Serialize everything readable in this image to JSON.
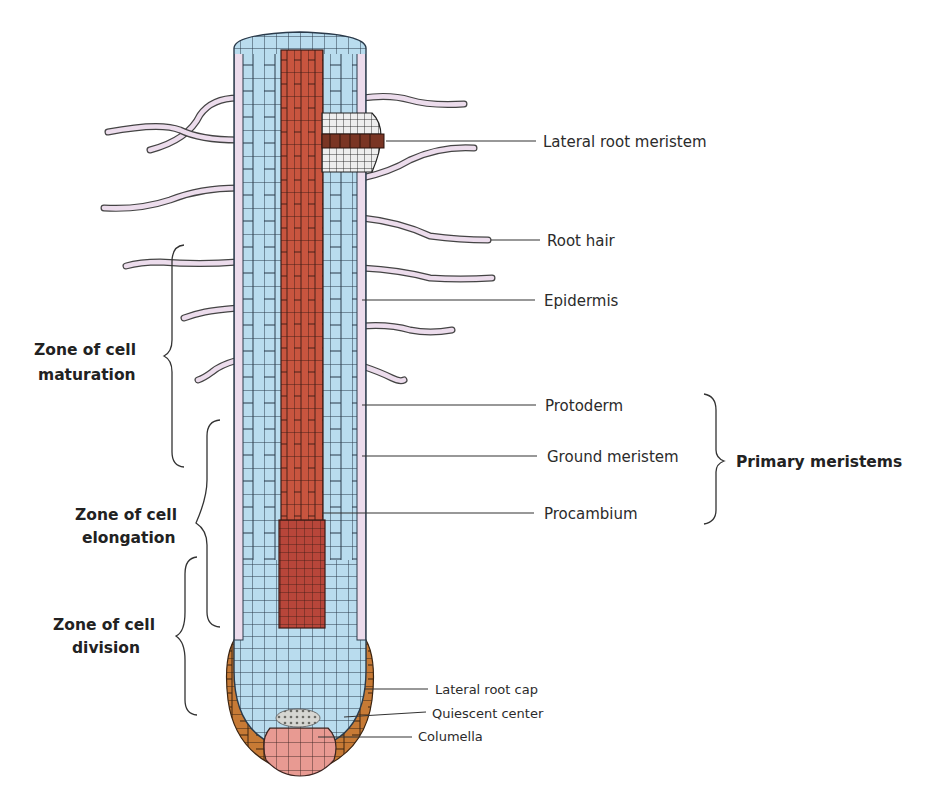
{
  "diagram": {
    "structure_labels": [
      {
        "id": "lateral_root_meristem",
        "text": "Lateral root meristem"
      },
      {
        "id": "root_hair",
        "text": "Root hair"
      },
      {
        "id": "epidermis",
        "text": "Epidermis"
      },
      {
        "id": "protoderm",
        "text": "Protoderm"
      },
      {
        "id": "ground_meristem",
        "text": "Ground meristem"
      },
      {
        "id": "procambium",
        "text": "Procambium"
      },
      {
        "id": "lateral_root_cap",
        "text": "Lateral root cap"
      },
      {
        "id": "quiescent_center",
        "text": "Quiescent center"
      },
      {
        "id": "columella",
        "text": "Columella"
      }
    ],
    "group_label": {
      "text": "Primary meristems",
      "members": [
        "Protoderm",
        "Ground meristem",
        "Procambium"
      ]
    },
    "zones": [
      {
        "line1": "Zone of cell",
        "line2": "maturation"
      },
      {
        "line1": "Zone of cell",
        "line2": "elongation"
      },
      {
        "line1": "Zone of cell",
        "line2": "division"
      }
    ],
    "colors": {
      "cortex": "#b9dcee",
      "epidermis": "#ecdcec",
      "vascular": "#c8553f",
      "root_cap": "#c77a35",
      "columella": "#e89a92",
      "outline": "#2a3a4a"
    }
  }
}
